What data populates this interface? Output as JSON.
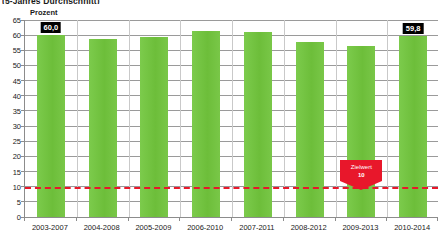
{
  "headline": "(5-Jahres Durchschnitt)",
  "axis_caption": "Prozent",
  "colors": {
    "bar": "#72c340",
    "target_line": "#e8172b",
    "label_box_bg": "#000000",
    "label_box_text": "#ffffff",
    "gridline": "#9a9a9a",
    "axis": "#8c8c8c",
    "background": "#ffffff"
  },
  "annotation": {
    "label": "Zielwert",
    "value": "10"
  },
  "chart_data": {
    "type": "bar",
    "title": "(5-Jahres Durchschnitt)",
    "subtitle": "",
    "xlabel": "",
    "ylabel": "Prozent",
    "ylim": [
      0,
      65
    ],
    "ytick_step": 5,
    "yticks": [
      "0",
      "5",
      "10",
      "15",
      "20",
      "25",
      "30",
      "35",
      "40",
      "45",
      "50",
      "55",
      "60",
      "65"
    ],
    "ytick_values": [
      0,
      5,
      10,
      15,
      20,
      25,
      30,
      35,
      40,
      45,
      50,
      55,
      60,
      65
    ],
    "grid": true,
    "legend": "none",
    "categories": [
      "2003-2007",
      "2004-2008",
      "2005-2009",
      "2006-2010",
      "2007-2011",
      "2008-2012",
      "2009-2013",
      "2010-2014"
    ],
    "values": [
      60.0,
      58.8,
      59.4,
      61.4,
      61.0,
      57.6,
      56.4,
      59.8
    ],
    "point_labels": [
      {
        "index": 0,
        "text": "60,0"
      },
      {
        "index": 7,
        "text": "59,8"
      }
    ],
    "reference_line": {
      "value": 10,
      "label": "Zielwert",
      "value_label": "10",
      "style": "dashed",
      "color": "#e8172b"
    }
  }
}
